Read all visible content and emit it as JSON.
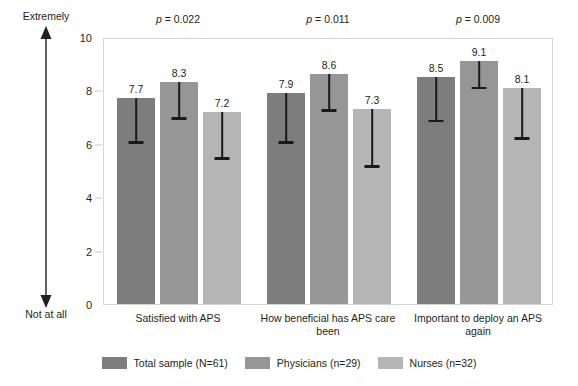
{
  "chart_data": {
    "type": "bar",
    "title": "",
    "subtitle": "",
    "xlabel": "",
    "ylabel": "",
    "ylim": [
      0,
      10
    ],
    "yticks": [
      0,
      2,
      4,
      6,
      8,
      10
    ],
    "ytick_labels": [
      "0",
      "2",
      "4",
      "6",
      "8",
      "10"
    ],
    "grid": false,
    "legend_position": "bottom",
    "orientation": "vertical",
    "error_bars": "lower-bound-only",
    "categories": [
      "Satisfied with APS",
      "How beneficial has APS care been",
      "Important to deploy an APS again"
    ],
    "series": [
      {
        "name": "Total sample (N=61)",
        "color": "#7d7d7d",
        "values": [
          7.7,
          7.9,
          8.5
        ],
        "labels": [
          "7.7",
          "7.9",
          "8.5"
        ],
        "error_low": [
          6.05,
          6.05,
          6.85
        ]
      },
      {
        "name": "Physicians (n=29)",
        "color": "#969696",
        "values": [
          8.3,
          8.6,
          9.1
        ],
        "labels": [
          "8.3",
          "8.6",
          "9.1"
        ],
        "error_low": [
          6.95,
          7.25,
          8.1
        ]
      },
      {
        "name": "Nurses (n=32)",
        "color": "#b5b5b5",
        "values": [
          7.2,
          7.3,
          8.1
        ],
        "labels": [
          "7.2",
          "7.3",
          "8.1"
        ],
        "error_low": [
          5.45,
          5.15,
          6.2
        ]
      }
    ],
    "annotations": {
      "p_values": [
        "p = 0.022",
        "p = 0.011",
        "p = 0.009"
      ],
      "p_value_numbers": [
        0.022,
        0.011,
        0.009
      ],
      "scale_top_label": "Extremely",
      "scale_bottom_label": "Not at all"
    }
  },
  "axis": {
    "scale_top_label": "Extremely",
    "scale_bottom_label": "Not at all"
  },
  "legend": {
    "items": [
      {
        "label": "Total sample (N=61)",
        "color": "#7d7d7d"
      },
      {
        "label": "Physicians (n=29)",
        "color": "#969696"
      },
      {
        "label": "Nurses (n=32)",
        "color": "#b5b5b5"
      }
    ]
  },
  "colors": {
    "total_sample": "#7d7d7d",
    "physicians": "#969696",
    "nurses": "#b5b5b5",
    "error_bar": "#1a1a1a",
    "frame": "#d6d6d6",
    "text": "#231f20",
    "background": "#ffffff"
  }
}
